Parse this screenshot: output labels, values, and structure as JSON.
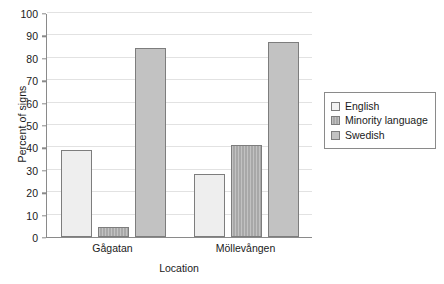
{
  "chart_data": {
    "type": "bar",
    "title": "",
    "subtitle": "",
    "xlabel": "Location",
    "ylabel": "Percent of signs",
    "categories": [
      "Gågatan",
      "Möllevången"
    ],
    "series": [
      {
        "name": "English",
        "values": [
          39,
          28
        ],
        "color": "#eeeeee"
      },
      {
        "name": "Minority language",
        "values": [
          4.5,
          41
        ],
        "color": "#a8a8a8"
      },
      {
        "name": "Swedish",
        "values": [
          84.5,
          87
        ],
        "color": "#c2c2c2"
      }
    ],
    "ylim": [
      0,
      100
    ],
    "yticks": [
      0,
      10,
      20,
      30,
      40,
      50,
      60,
      70,
      80,
      90,
      100
    ],
    "ytick_labels": [
      "0",
      "10",
      "20",
      "30",
      "40",
      "50",
      "60",
      "70",
      "80",
      "90",
      "100"
    ],
    "grid": true,
    "grid_axis": "y",
    "legend_position": "right",
    "legend_entries": [
      "English",
      "Minority language",
      "Swedish"
    ]
  },
  "axes": {
    "y_title": "Percent of signs",
    "x_title": "Location"
  },
  "colors": {
    "english": "#eeeeee",
    "minority": "#a8a8a8",
    "swedish": "#c2c2c2",
    "axis": "#8a8a8a",
    "grid": "#e2e2e2",
    "bar_border": "#7d7d7d",
    "text": "#1a1a1a",
    "background": "#ffffff"
  }
}
